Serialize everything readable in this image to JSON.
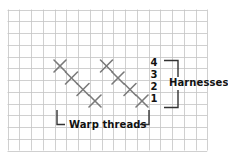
{
  "diagram": {
    "type": "weaving-draft",
    "grid": {
      "x0": 7.5,
      "y0": 9.5,
      "cell": 11.75,
      "cols": 17,
      "rows": 12,
      "line_color": "#c4c4c4"
    },
    "marks": {
      "color": "#7a7a7a",
      "size": 6,
      "groups": [
        {
          "name": "left-diagonal",
          "points": [
            [
              60,
              66
            ],
            [
              71.5,
              78
            ],
            [
              83,
              89.5
            ],
            [
              95,
              101
            ]
          ]
        },
        {
          "name": "right-diagonal",
          "points": [
            [
              106.5,
              66
            ],
            [
              118,
              78
            ],
            [
              130,
              89.5
            ],
            [
              142,
              101
            ]
          ]
        }
      ]
    },
    "harness_numbers": [
      {
        "label": "4",
        "x": 149,
        "y": 58
      },
      {
        "label": "3",
        "x": 149,
        "y": 70
      },
      {
        "label": "2",
        "x": 149,
        "y": 82
      },
      {
        "label": "1",
        "x": 149,
        "y": 94
      }
    ],
    "harnesses_label": "Harnesses",
    "warp_label": "Warp threads",
    "bracket_color": "#333333"
  }
}
